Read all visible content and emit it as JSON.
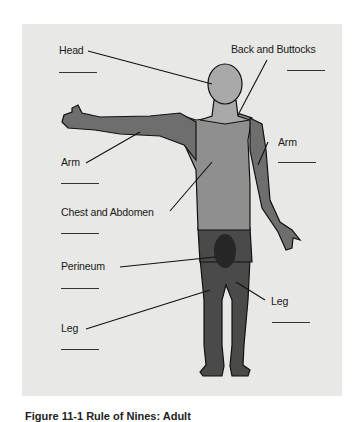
{
  "figure": {
    "labels": {
      "head": "Head",
      "back_buttocks": "Back and Buttocks",
      "arm_left": "Arm",
      "arm_right": "Arm",
      "chest_abdomen": "Chest and Abdomen",
      "perineum": "Perineum",
      "leg_left": "Leg",
      "leg_right": "Leg"
    },
    "colors": {
      "background": "#e8e8e6",
      "head_neck": "#a9a9a9",
      "trunk": "#8f8f8f",
      "arm": "#6e6e6e",
      "legs": "#4a4a4a",
      "perineum": "#262626",
      "outline": "#111111"
    },
    "caption": "Figure 11-1  Rule of Nines: Adult"
  }
}
